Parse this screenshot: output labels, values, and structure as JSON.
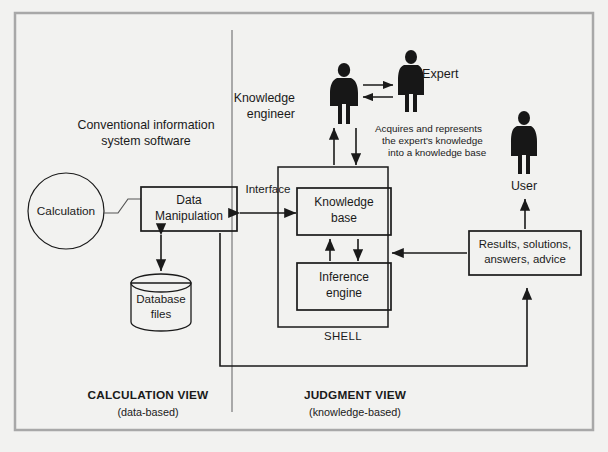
{
  "figure": {
    "background_color": "#f2f2f0",
    "frame_color": "#a8a8a8",
    "line_color": "#1a1a1a",
    "divider_color": "#8a8a8a"
  },
  "left_panel": {
    "caption_line1": "Conventional information",
    "caption_line2": "system software",
    "calculation_node": "Calculation",
    "data_manipulation_line1": "Data",
    "data_manipulation_line2": "Manipulation",
    "database_line1": "Database",
    "database_line2": "files"
  },
  "center": {
    "interface_label": "Interface"
  },
  "right_panel": {
    "knowledge_engineer_line1": "Knowledge",
    "knowledge_engineer_line2": "engineer",
    "expert_label": "Expert",
    "user_label": "User",
    "annotation_line1": "Acquires and represents",
    "annotation_line2": "the expert's knowledge",
    "annotation_line3": "into a knowledge base",
    "knowledge_base_line1": "Knowledge",
    "knowledge_base_line2": "base",
    "inference_engine_line1": "Inference",
    "inference_engine_line2": "engine",
    "shell_label": "SHELL",
    "results_line1": "Results, solutions,",
    "results_line2": "answers, advice"
  },
  "footer": {
    "left_title": "CALCULATION VIEW",
    "left_subtitle": "(data-based)",
    "right_title": "JUDGMENT VIEW",
    "right_subtitle": "(knowledge-based)"
  }
}
